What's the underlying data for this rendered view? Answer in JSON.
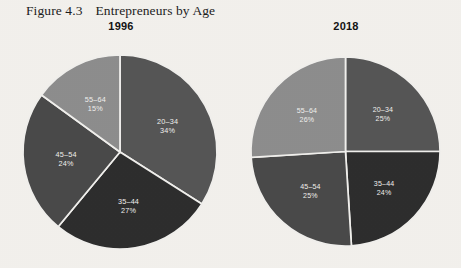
{
  "figure": {
    "number": "Figure 4.3",
    "title": "Entrepreneurs by Age"
  },
  "colors": {
    "background": "#f4f2ee",
    "divider": "#f2f1ee",
    "label_text": "#f2f1ee",
    "title_text": "#1d1d1d",
    "slice_20_34": "#565656",
    "slice_35_44": "#2e2e2e",
    "slice_45_54": "#4a4a4a",
    "slice_55_64": "#8e8e8e"
  },
  "charts": [
    {
      "key": "chart_1996",
      "label": "1996",
      "slices": [
        {
          "category": "20–34",
          "percent_label": "34%",
          "value": 34,
          "color": "#565656"
        },
        {
          "category": "35–44",
          "percent_label": "27%",
          "value": 27,
          "color": "#2e2e2e"
        },
        {
          "category": "45–54",
          "percent_label": "24%",
          "value": 24,
          "color": "#4a4a4a"
        },
        {
          "category": "55–64",
          "percent_label": "15%",
          "value": 15,
          "color": "#8e8e8e"
        }
      ]
    },
    {
      "key": "chart_2018",
      "label": "2018",
      "slices": [
        {
          "category": "20–34",
          "percent_label": "25%",
          "value": 25,
          "color": "#565656"
        },
        {
          "category": "35–44",
          "percent_label": "24%",
          "value": 24,
          "color": "#2e2e2e"
        },
        {
          "category": "45–54",
          "percent_label": "25%",
          "value": 25,
          "color": "#4a4a4a"
        },
        {
          "category": "55–64",
          "percent_label": "26%",
          "value": 26,
          "color": "#8e8e8e"
        }
      ]
    }
  ],
  "chart_data": [
    {
      "type": "pie",
      "title": "1996",
      "categories": [
        "20–34",
        "35–44",
        "45–54",
        "55–64"
      ],
      "values": [
        34,
        27,
        24,
        15
      ],
      "data_labels": [
        "34%",
        "27%",
        "24%",
        "15%"
      ],
      "units": "percent",
      "start_angle_deg": 0,
      "direction": "clockwise",
      "legend": "none",
      "grid": false
    },
    {
      "type": "pie",
      "title": "2018",
      "categories": [
        "20–34",
        "35–44",
        "45–54",
        "55–64"
      ],
      "values": [
        25,
        24,
        25,
        26
      ],
      "data_labels": [
        "25%",
        "24%",
        "25%",
        "26%"
      ],
      "units": "percent",
      "start_angle_deg": 0,
      "direction": "clockwise",
      "legend": "none",
      "grid": false
    }
  ]
}
